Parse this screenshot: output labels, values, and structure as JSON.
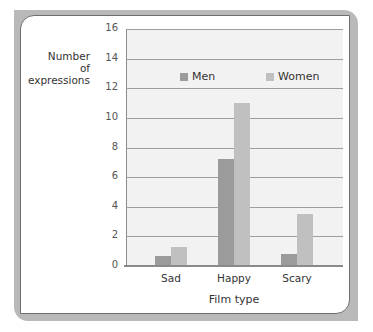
{
  "chart_data": {
    "type": "bar",
    "title": "",
    "xlabel": "Film type",
    "ylabel": "Number of expressions",
    "ylabel_lines": [
      "Number",
      "of",
      "expressions"
    ],
    "categories": [
      "Sad",
      "Happy",
      "Scary"
    ],
    "series": [
      {
        "name": "Men",
        "color": "#9b9b9b",
        "values": [
          0.7,
          7.2,
          0.8
        ]
      },
      {
        "name": "Women",
        "color": "#c0c0c0",
        "values": [
          1.3,
          11,
          3.5
        ]
      }
    ],
    "ylim": [
      0,
      16
    ],
    "yticks": [
      "0",
      "2",
      "4",
      "6",
      "8",
      "10",
      "12",
      "14",
      "16"
    ],
    "grid": true,
    "legend_position": "top-inside"
  },
  "legend": {
    "men": "Men",
    "women": "Women"
  }
}
